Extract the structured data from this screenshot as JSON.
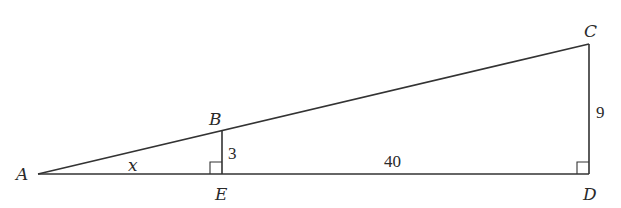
{
  "diagram": {
    "type": "similar right triangles",
    "points": {
      "A": {
        "label": "A",
        "x": 38,
        "y": 174
      },
      "B": {
        "label": "B",
        "x": 222,
        "y": 130
      },
      "C": {
        "label": "C",
        "x": 589,
        "y": 44
      },
      "D": {
        "label": "D",
        "x": 589,
        "y": 174
      },
      "E": {
        "label": "E",
        "x": 222,
        "y": 174
      }
    },
    "segments": [
      {
        "from": "A",
        "to": "C"
      },
      {
        "from": "A",
        "to": "D"
      },
      {
        "from": "B",
        "to": "E"
      },
      {
        "from": "C",
        "to": "D"
      }
    ],
    "right_angles": [
      "E",
      "D"
    ],
    "measures": {
      "BE": "3",
      "ED": "40",
      "CD": "9",
      "angle_A": "x"
    },
    "labels": {
      "A": "A",
      "B": "B",
      "C": "C",
      "D": "D",
      "E": "E",
      "x": "x",
      "three": "3",
      "forty": "40",
      "nine": "9"
    },
    "colors": {
      "line": "#333333",
      "text": "#2a2a2a",
      "background": "#ffffff"
    }
  }
}
